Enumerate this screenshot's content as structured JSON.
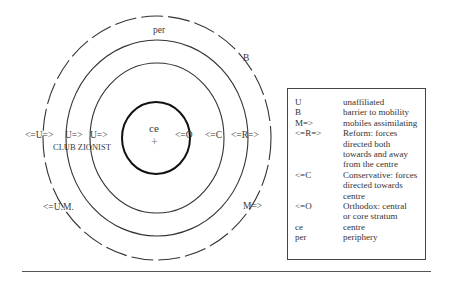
{
  "diagram": {
    "centre_label": "ce",
    "centre_mark": "+",
    "ring_labels": {
      "periphery": "per",
      "barrier": "B"
    },
    "arrow_labels": {
      "unaffiliated_outer": "<=U=>",
      "unaffiliated_mid": "U=>",
      "unaffiliated_inner": "U=>",
      "club_zionist": "CLUB ZIONIST",
      "orthodox": "<=O",
      "conservative": "<=C",
      "reform": "<=R=>",
      "unaffiliated_mobiles": "<=U.M.",
      "mobiles": "M=>"
    }
  },
  "legend": {
    "items": [
      {
        "key": "U",
        "desc": [
          "unaffiliated"
        ]
      },
      {
        "key": "B",
        "desc": [
          "barrier to mobility"
        ]
      },
      {
        "key": "M=>",
        "desc": [
          "mobiles assimilating"
        ]
      },
      {
        "key": "<=R=>",
        "desc": [
          "Reform: forces",
          "directed both",
          "towards and away",
          "from the centre"
        ]
      },
      {
        "key": "<=C",
        "desc": [
          "Conservative: forces",
          "directed towards",
          "centre"
        ]
      },
      {
        "key": "<=O",
        "desc": [
          "Orthodox: central",
          "or core  stratum"
        ]
      },
      {
        "key": "ce",
        "desc": [
          "centre"
        ]
      },
      {
        "key": "per",
        "desc": [
          "periphery"
        ]
      }
    ]
  }
}
